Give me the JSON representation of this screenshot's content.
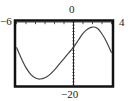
{
  "chart_data": {
    "type": "line",
    "title": "",
    "xlabel": "",
    "ylabel": "",
    "xlim": [
      -6,
      4
    ],
    "ylim": [
      -20,
      0
    ],
    "window_labels": {
      "xmin": "−6",
      "xmax": "4",
      "ymin": "−20",
      "ymax": "0"
    },
    "grid": false,
    "x_tick_step": 1,
    "y_tick_step": 1,
    "series": [
      {
        "name": "curve",
        "x": [
          -6,
          -5.5,
          -5,
          -4.5,
          -4,
          -3.5,
          -3,
          -2.5,
          -2,
          -1.5,
          -1,
          -0.5,
          0,
          0.5,
          1,
          1.5,
          2,
          2.5,
          3,
          3.5,
          4
        ],
        "y": [
          -8,
          -11.5,
          -14.5,
          -16.6,
          -17.8,
          -18.1,
          -17.7,
          -16.7,
          -15.2,
          -13.4,
          -11.6,
          -9.8,
          -8.0,
          -5.8,
          -3.6,
          -2.2,
          -1.6,
          -2.0,
          -3.8,
          -6.4,
          -9.8
        ]
      }
    ],
    "colors": {
      "curve": "#444444",
      "frame": "#111111",
      "axis": "#222222"
    }
  }
}
